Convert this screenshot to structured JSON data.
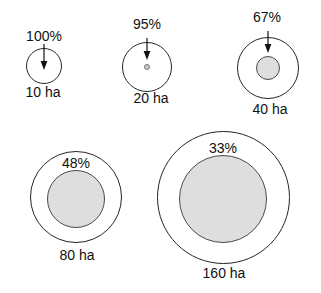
{
  "figure": {
    "width": 321,
    "height": 293,
    "background_color": "#ffffff",
    "outline_color": "#262626",
    "core_fill_color": "#dedede",
    "core_outline_color": "#4a4a4a",
    "text_color": "#111111"
  },
  "items": [
    {
      "id": "patch-10-ha",
      "area_label": "10 ha",
      "percent_label": "100%",
      "has_arrow": true,
      "label_inside": false,
      "outer": {
        "cx": 44,
        "cy": 66,
        "d": 36
      },
      "core": {
        "cx": 44,
        "cy": 66,
        "d": 0
      },
      "percent_pos": {
        "cx": 44,
        "top": 28
      },
      "area_pos": {
        "cx": 43,
        "top": 84
      },
      "arrow": {
        "x": 44,
        "y1": 44,
        "y2": 70
      }
    },
    {
      "id": "patch-20-ha",
      "area_label": "20 ha",
      "percent_label": "95%",
      "has_arrow": true,
      "label_inside": false,
      "outer": {
        "cx": 147,
        "cy": 67,
        "d": 50
      },
      "core": {
        "cx": 147,
        "cy": 67,
        "d": 6
      },
      "percent_pos": {
        "cx": 147,
        "top": 16
      },
      "area_pos": {
        "cx": 151,
        "top": 90
      },
      "arrow": {
        "x": 147,
        "y1": 38,
        "y2": 60
      }
    },
    {
      "id": "patch-40-ha",
      "area_label": "40 ha",
      "percent_label": "67%",
      "has_arrow": true,
      "label_inside": false,
      "outer": {
        "cx": 268,
        "cy": 68,
        "d": 62
      },
      "core": {
        "cx": 268,
        "cy": 68,
        "d": 24
      },
      "percent_pos": {
        "cx": 267,
        "top": 9
      },
      "area_pos": {
        "cx": 270,
        "top": 101
      },
      "arrow": {
        "x": 268,
        "y1": 31,
        "y2": 53
      }
    },
    {
      "id": "patch-80-ha",
      "area_label": "80 ha",
      "percent_label": "48%",
      "has_arrow": false,
      "label_inside": true,
      "outer": {
        "cx": 76,
        "cy": 197,
        "d": 92
      },
      "core": {
        "cx": 76,
        "cy": 199,
        "d": 58
      },
      "percent_pos": {
        "cx": 76,
        "top": 155
      },
      "area_pos": {
        "cx": 77,
        "top": 247
      },
      "arrow": null
    },
    {
      "id": "patch-160-ha",
      "area_label": "160 ha",
      "percent_label": "33%",
      "has_arrow": false,
      "label_inside": true,
      "outer": {
        "cx": 223,
        "cy": 197,
        "d": 133
      },
      "core": {
        "cx": 223,
        "cy": 199,
        "d": 88
      },
      "percent_pos": {
        "cx": 223,
        "top": 140
      },
      "area_pos": {
        "cx": 224,
        "top": 265
      },
      "arrow": null
    }
  ]
}
